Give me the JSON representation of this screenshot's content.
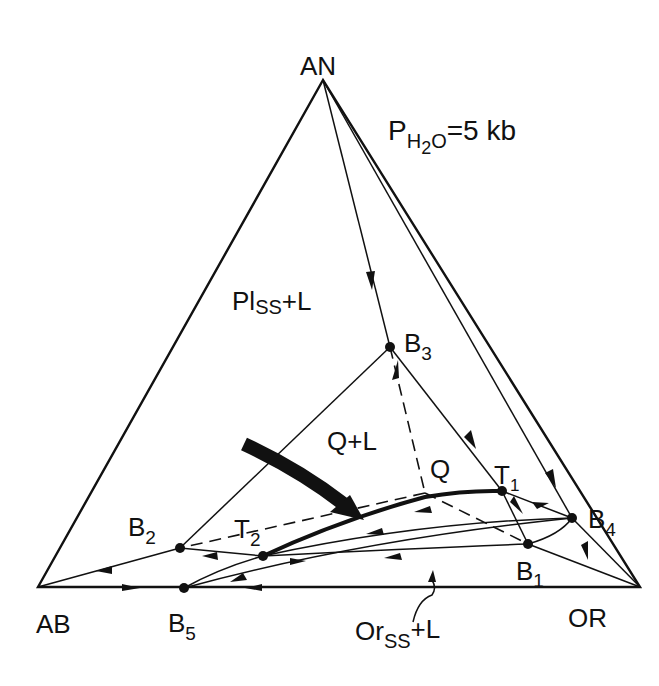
{
  "diagram": {
    "type": "ternary phase diagram",
    "pressure_label": {
      "main": "P",
      "sub": "H",
      "sub2": "2",
      "sub3": "O",
      "rest": "=5 kb"
    },
    "vertices": [
      {
        "id": "AN",
        "label": "AN",
        "x": 323,
        "y": 80
      },
      {
        "id": "AB",
        "label": "AB",
        "x": 38,
        "y": 587
      },
      {
        "id": "OR",
        "label": "OR",
        "x": 640,
        "y": 587
      }
    ],
    "points": [
      {
        "id": "B1",
        "label": "B",
        "sub": "1",
        "x": 528,
        "y": 544
      },
      {
        "id": "B2",
        "label": "B",
        "sub": "2",
        "x": 180,
        "y": 548
      },
      {
        "id": "B3",
        "label": "B",
        "sub": "3",
        "x": 390,
        "y": 347
      },
      {
        "id": "B4",
        "label": "B",
        "sub": "4",
        "x": 572,
        "y": 518
      },
      {
        "id": "B5",
        "label": "B",
        "sub": "5",
        "x": 184,
        "y": 588
      },
      {
        "id": "T1",
        "label": "T",
        "sub": "1",
        "x": 502,
        "y": 491
      },
      {
        "id": "T2",
        "label": "T",
        "sub": "2",
        "x": 263,
        "y": 556
      },
      {
        "id": "Q",
        "label": "Q",
        "x": 425,
        "y": 493
      }
    ],
    "fields": [
      {
        "id": "pl-field",
        "label": "Pl",
        "sub": "SS",
        "rest": "+L"
      },
      {
        "id": "q-field",
        "label": "Q+L"
      },
      {
        "id": "or-field",
        "label": "Or",
        "sub": "SS",
        "rest": "+L"
      }
    ]
  }
}
